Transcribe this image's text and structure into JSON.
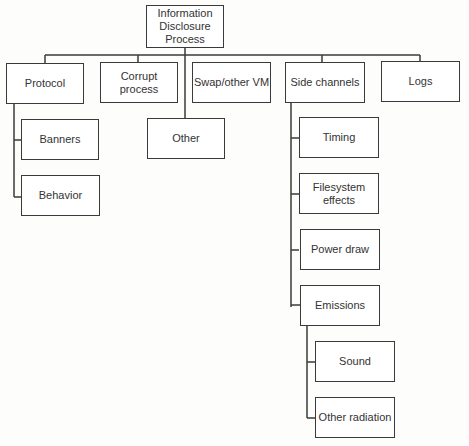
{
  "diagram": {
    "type": "tree",
    "root": {
      "id": "root",
      "label": "Information Disclosure Process"
    },
    "nodes": [
      {
        "id": "protocol",
        "label": "Protocol",
        "parent": "root"
      },
      {
        "id": "corrupt",
        "label": "Corrupt process",
        "parent": "root"
      },
      {
        "id": "other",
        "label": "Other",
        "parent": "root"
      },
      {
        "id": "swap",
        "label": "Swap/other VM",
        "parent": "root"
      },
      {
        "id": "side",
        "label": "Side channels",
        "parent": "root"
      },
      {
        "id": "logs",
        "label": "Logs",
        "parent": "root"
      },
      {
        "id": "banners",
        "label": "Banners",
        "parent": "protocol"
      },
      {
        "id": "behavior",
        "label": "Behavior",
        "parent": "protocol"
      },
      {
        "id": "timing",
        "label": "Timing",
        "parent": "side"
      },
      {
        "id": "filesystem",
        "label": "Filesystem effects",
        "parent": "side"
      },
      {
        "id": "power",
        "label": "Power draw",
        "parent": "side"
      },
      {
        "id": "emissions",
        "label": "Emissions",
        "parent": "side"
      },
      {
        "id": "sound",
        "label": "Sound",
        "parent": "emissions"
      },
      {
        "id": "radiation",
        "label": "Other radiation",
        "parent": "emissions"
      }
    ]
  },
  "labels": {
    "root_line1": "Information",
    "root_line2": "Disclosure",
    "root_line3": "Process"
  }
}
